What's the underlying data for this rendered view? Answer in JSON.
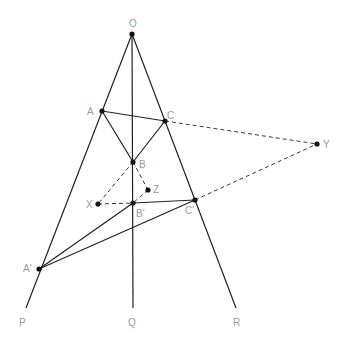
{
  "diagram": {
    "title": "",
    "colors": {
      "line": "#222222",
      "point": "#111111",
      "label": "#9a9a9a",
      "background": "#ffffff"
    },
    "points": {
      "O": {
        "x": 132,
        "y": 34,
        "label": "O",
        "lx": 129,
        "ly": 27
      },
      "A": {
        "x": 102,
        "y": 111,
        "label": "A",
        "lx": 87,
        "ly": 115
      },
      "C": {
        "x": 165,
        "y": 121,
        "label": "C",
        "lx": 167,
        "ly": 119
      },
      "B": {
        "x": 133,
        "y": 162,
        "label": "B",
        "lx": 139,
        "ly": 168
      },
      "Z": {
        "x": 148,
        "y": 190,
        "label": "Z",
        "lx": 153,
        "ly": 193
      },
      "X": {
        "x": 98,
        "y": 204,
        "label": "X",
        "lx": 86,
        "ly": 208
      },
      "B'": {
        "x": 133,
        "y": 203,
        "label": "B'",
        "lx": 136,
        "ly": 217
      },
      "C'": {
        "x": 195,
        "y": 200,
        "label": "C'",
        "lx": 185,
        "ly": 214
      },
      "Y": {
        "x": 317,
        "y": 144,
        "label": "Y",
        "lx": 323,
        "ly": 148
      },
      "A'": {
        "x": 39,
        "y": 269,
        "label": "A'",
        "lx": 23,
        "ly": 272
      },
      "P": {
        "x": 26,
        "y": 308,
        "label": "P",
        "lx": 19,
        "ly": 326
      },
      "Q": {
        "x": 133,
        "y": 308,
        "label": "Q",
        "lx": 128,
        "ly": 326
      },
      "R": {
        "x": 236,
        "y": 308,
        "label": "R",
        "lx": 233,
        "ly": 326
      }
    },
    "dots": [
      "O",
      "A",
      "C",
      "B",
      "Z",
      "X",
      "B'",
      "C'",
      "Y",
      "A'"
    ],
    "segments_solid": [
      [
        "O",
        "P"
      ],
      [
        "O",
        "Q"
      ],
      [
        "O",
        "R"
      ],
      [
        "A",
        "C"
      ],
      [
        "A",
        "B"
      ],
      [
        "C",
        "B"
      ],
      [
        "A'",
        "B'"
      ],
      [
        "B'",
        "C'"
      ],
      [
        "A'",
        "C'"
      ]
    ],
    "segments_dashed": [
      [
        "C",
        "Y"
      ],
      [
        "C'",
        "Y"
      ],
      [
        "B",
        "X"
      ],
      [
        "X",
        "B'"
      ],
      [
        "B",
        "Z"
      ],
      [
        "Z",
        "B'"
      ]
    ]
  }
}
